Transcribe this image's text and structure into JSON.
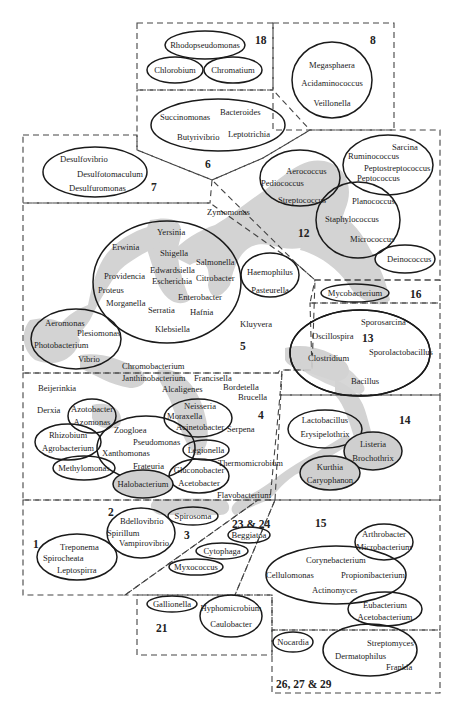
{
  "diagram": {
    "type": "taxonomic-grouping-map",
    "groups": {
      "g18": {
        "label": "18",
        "genera": [
          "Rhodopseudomonas",
          "Chlorobium",
          "Chromatium"
        ]
      },
      "g8": {
        "label": "8",
        "genera": [
          "Megasphaera",
          "Acidaminococcus",
          "Veillonella"
        ]
      },
      "g6": {
        "label": "6",
        "genera": [
          "Succinomonas",
          "Bacteroides",
          "Butyrivibrio",
          "Leptotrichia"
        ]
      },
      "g7": {
        "label": "7",
        "genera": [
          "Desulfovibrio",
          "Desulfotomaculum",
          "Desulfuromonas"
        ]
      },
      "g12": {
        "label": "12",
        "genera": [
          "Aerococcus",
          "Pediococcus",
          "Streptococcus",
          "Sarcina",
          "Ruminococcus",
          "Peptostreptococcus",
          "Peptococcus",
          "Planococcus",
          "Staphylococcus",
          "Micrococcus",
          "Deinococcus"
        ]
      },
      "g5": {
        "label": "5",
        "genera": [
          "Zymomonas",
          "Yersinia",
          "Erwinia",
          "Shigella",
          "Salmonella",
          "Edwardsiella",
          "Providencia",
          "Escherichia",
          "Citrobacter",
          "Proteus",
          "Enterobacter",
          "Morganella",
          "Serratia",
          "Hafnia",
          "Klebsiella",
          "Haemophilus",
          "Pasteurella",
          "Kluyvera",
          "Aeromonas",
          "Plesiomonas",
          "Photobacterium",
          "Vibrio",
          "Chromobacterium"
        ]
      },
      "g16": {
        "label": "16",
        "genera": [
          "Mycobacterium"
        ]
      },
      "g13": {
        "label": "13",
        "genera": [
          "Sporosarcina",
          "Oscillospira",
          "Sporolactobacillus",
          "Clostridium",
          "Bacillus"
        ]
      },
      "g4": {
        "label": "4",
        "genera": [
          "Janthinobacterium",
          "Francisella",
          "Beijerinkia",
          "Alcaligenes",
          "Bordetella",
          "Brucella",
          "Derxia",
          "Azotobacter",
          "Azomonas",
          "Neisseria",
          "Moraxella",
          "Acinetobacter",
          "Serpena",
          "Rhizobium",
          "Agrobacterium",
          "Zoogloea",
          "Pseudomonas",
          "Xanthomonas",
          "Legionella",
          "Frateuria",
          "Thermomicrobium",
          "Methylomonas",
          "Gluconobacter",
          "Acetobacter",
          "Halobacterium",
          "Flavobacterium"
        ]
      },
      "g14": {
        "label": "14",
        "genera": [
          "Lactobacillus",
          "Erysipelothrix",
          "Listeria",
          "Brochothrix",
          "Kurthia",
          "Caryophanon"
        ]
      },
      "g1": {
        "label": "1",
        "genera": [
          "Treponema",
          "Spirocheata",
          "Leptospirra"
        ]
      },
      "g2": {
        "label": "2",
        "genera": [
          "Bdellovibrio",
          "Spirillum",
          "Vampirovibrio"
        ]
      },
      "g3": {
        "label": "3",
        "genera": [
          "Spirosoma"
        ]
      },
      "g23_24": {
        "label": "23 & 24",
        "genera": [
          "Beggiatoa",
          "Cytophaga",
          "Myxococcus"
        ]
      },
      "g15": {
        "label": "15",
        "genera": [
          "Arthrobacter",
          "Microbacterium",
          "Corynebacterium",
          "Cellulomonas",
          "Propionibacterium",
          "Actinomyces",
          "Eubacterium",
          "Acetobacterium"
        ]
      },
      "g21": {
        "label": "21",
        "genera": [
          "Gallionella",
          "Hyphomicrobium",
          "Caulobacter"
        ]
      },
      "g26_27_29": {
        "label": "26, 27 & 29",
        "genera": [
          "Nocardia",
          "Streptomyces",
          "Dermatophilus",
          "Frankia"
        ]
      }
    },
    "colors": {
      "line": "#1a1a1a",
      "box": "#444444",
      "shade": "#d3d3d3",
      "background": "#ffffff"
    }
  }
}
